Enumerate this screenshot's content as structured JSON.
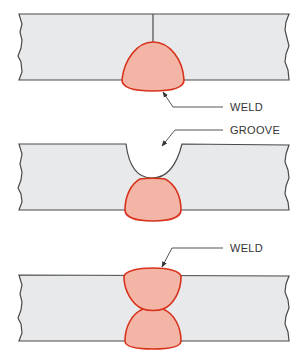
{
  "diagram": {
    "type": "weld cross-sections",
    "panels": [
      {
        "id": "top",
        "description": "square butt joint with root-side weld bead",
        "label": "WELD"
      },
      {
        "id": "middle",
        "description": "back-gouged groove above weld bead",
        "label": "GROOVE"
      },
      {
        "id": "bottom",
        "description": "double-sided weld (both beads fused)",
        "label": "WELD"
      }
    ],
    "colors": {
      "plate_fill": "#e8e9eb",
      "plate_outline": "#4a4a4a",
      "weld_fill": "#f3b6a6",
      "weld_outline": "#d8321c",
      "leader_line": "#555555"
    }
  }
}
